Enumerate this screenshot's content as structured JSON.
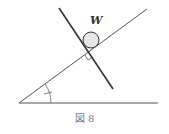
{
  "figure": {
    "caption": "図 8",
    "weight_label": "W",
    "colors": {
      "line": "#333333",
      "thin": "#555555",
      "circle_fill": "#e6e6e6"
    }
  }
}
